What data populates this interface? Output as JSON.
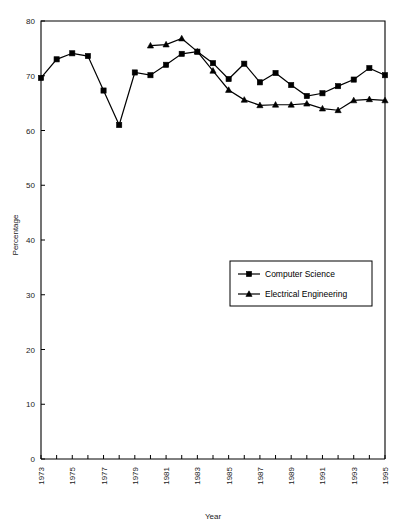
{
  "chart_data": {
    "type": "line",
    "title": "",
    "xlabel": "Year",
    "ylabel": "Percentage",
    "xlim": [
      1973,
      1995
    ],
    "ylim": [
      0,
      80
    ],
    "ytick_step": 10,
    "xtick_step": 1,
    "xtick_label_step": 2,
    "grid": false,
    "legend_position": "center-right",
    "ytick_labels": [
      "0",
      "10",
      "20",
      "30",
      "40",
      "50",
      "60",
      "70",
      "80"
    ],
    "ytick_values": [
      0,
      10,
      20,
      30,
      40,
      50,
      60,
      70,
      80
    ],
    "xtick_labels": [
      "1973",
      "1975",
      "1977",
      "1979",
      "1981",
      "1983",
      "1985",
      "1987",
      "1989",
      "1991",
      "1993",
      "1995"
    ],
    "xtick_values": [
      1973,
      1975,
      1977,
      1979,
      1981,
      1983,
      1985,
      1987,
      1989,
      1991,
      1993,
      1995
    ],
    "x": [
      1973,
      1974,
      1975,
      1976,
      1977,
      1978,
      1979,
      1980,
      1981,
      1982,
      1983,
      1984,
      1985,
      1986,
      1987,
      1988,
      1989,
      1990,
      1991,
      1992,
      1993,
      1994,
      1995
    ],
    "series": [
      {
        "name": "Computer Science",
        "marker": "square",
        "x": [
          1973,
          1974,
          1975,
          1976,
          1977,
          1978,
          1979,
          1980,
          1981,
          1982,
          1983,
          1984,
          1985,
          1986,
          1987,
          1988,
          1989,
          1990,
          1991,
          1992,
          1993,
          1994,
          1995
        ],
        "values": [
          69.6,
          73.0,
          74.1,
          73.6,
          67.3,
          61.0,
          70.6,
          70.1,
          72.0,
          74.0,
          74.4,
          72.3,
          69.4,
          72.2,
          68.8,
          70.5,
          68.3,
          66.3,
          66.8,
          68.1,
          69.3,
          71.4,
          70.1
        ]
      },
      {
        "name": "Electrical Engineering",
        "marker": "triangle",
        "x": [
          1980,
          1981,
          1982,
          1983,
          1984,
          1985,
          1986,
          1987,
          1988,
          1989,
          1990,
          1991,
          1992,
          1993,
          1994,
          1995
        ],
        "values": [
          75.5,
          75.7,
          76.8,
          74.4,
          70.9,
          67.4,
          65.6,
          64.6,
          64.7,
          64.7,
          64.9,
          64.0,
          63.7,
          65.5,
          65.7,
          65.5
        ]
      }
    ],
    "colors": {
      "line": "#000000",
      "marker": "#000000",
      "axis": "#000000",
      "background": "#ffffff"
    }
  },
  "legend": {
    "items": [
      {
        "label": "Computer Science",
        "marker": "square"
      },
      {
        "label": "Electrical Engineering",
        "marker": "triangle"
      }
    ]
  }
}
